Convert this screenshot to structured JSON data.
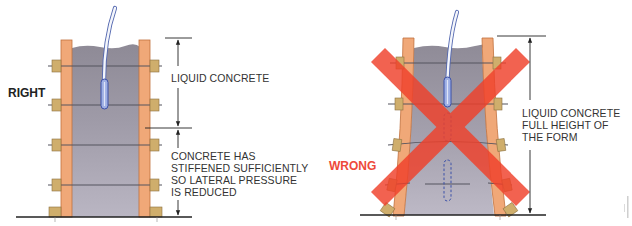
{
  "diagram": {
    "colors": {
      "form_wood": "#f0a878",
      "form_wood_stroke": "#c0703c",
      "concrete_top": "#8e8a96",
      "concrete_bottom": "#b7b3c0",
      "tie_rod": "#55555f",
      "tie_block": "#cfae6c",
      "tie_block_stroke": "#8c7040",
      "vibrator_hose": "#f4f6fb",
      "vibrator_hose_stroke": "#5468b0",
      "vibrator_head": "#9fb0e4",
      "vibrator_head_stroke": "#3b50a8",
      "ground_line": "#222222",
      "dimension_line": "#222222",
      "wrong_x": "#f0402a",
      "right_label": "#222222",
      "wrong_label": "#ee4a3a",
      "text": "#333333"
    },
    "right_panel": {
      "verdict": "RIGHT",
      "labels": {
        "upper": "LIQUID CONCRETE",
        "lower_lines": [
          "CONCRETE HAS",
          "STIFFENED SUFFICIENTLY",
          "SO LATERAL PRESSURE",
          "IS REDUCED"
        ]
      }
    },
    "wrong_panel": {
      "verdict": "WRONG",
      "labels": {
        "main_lines": [
          "LIQUID CONCRETE",
          "FULL HEIGHT OF",
          "THE FORM"
        ]
      }
    },
    "side_credit": "illegible vertical text"
  }
}
